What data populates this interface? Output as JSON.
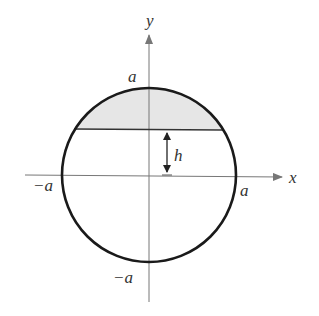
{
  "diagram": {
    "type": "circle-segment",
    "axes": {
      "x_label": "x",
      "y_label": "y"
    },
    "labels": {
      "top": "a",
      "bottom": "−a",
      "left": "−a",
      "right": "a",
      "height": "h"
    },
    "colors": {
      "circle": "#1a1a1a",
      "axes": "#777777",
      "shading": "#e6e6e6",
      "chord": "#333333"
    }
  }
}
